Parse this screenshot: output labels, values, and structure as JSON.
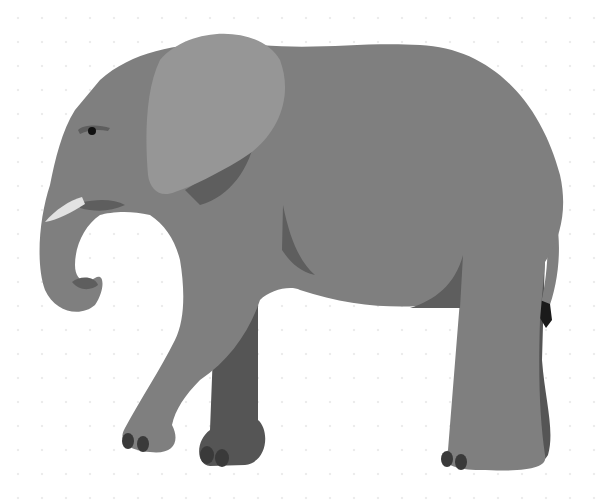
{
  "image": {
    "subject": "elephant",
    "style": "flat grayscale illustration",
    "background": "white with faint dot pattern"
  },
  "colors": {
    "background": "#ffffff",
    "pattern_dot": "#ececec",
    "body": "#7f7f7f",
    "ear": "#969696",
    "shadow": "#5e5e5e",
    "far_leg": "#555555",
    "toenail": "#3a3a3a",
    "tusk": "#e2e2e2",
    "eye": "#111111",
    "tail_tuft": "#1a1a1a"
  }
}
